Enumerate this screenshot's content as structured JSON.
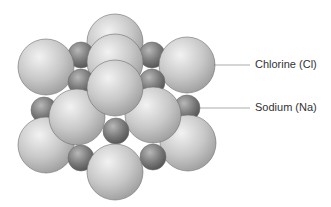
{
  "diagram": {
    "labels": {
      "chlorine": "Chlorine (Cl)",
      "sodium": "Sodium (Na)"
    },
    "colors": {
      "chlorine_light": "#f2f2f2",
      "chlorine_mid": "#c8c8c8",
      "chlorine_dark": "#9a9a9a",
      "sodium_light": "#b8b8b8",
      "sodium_mid": "#7a7a7a",
      "sodium_dark": "#4e4e4e",
      "outline": "#6e6e6e",
      "leader_line": "#888888",
      "label_text": "#333333"
    },
    "atom_counts": {
      "chlorine": 10,
      "sodium": 9
    }
  }
}
